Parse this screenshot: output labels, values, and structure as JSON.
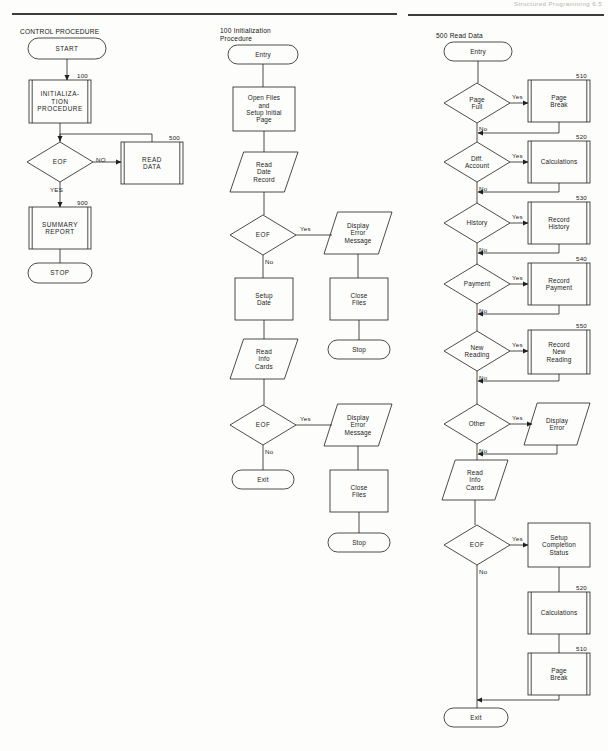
{
  "page": {
    "header_text": "Structured Programming   6.5",
    "background": "#fdfdfb",
    "line_color": "#1f1f1f",
    "width": 608,
    "height": 751
  },
  "columns": [
    {
      "id": "control-procedure",
      "title": "CONTROL PROCEDURE",
      "nodes": [
        {
          "id": "start",
          "shape": "terminator",
          "label": "START",
          "ref": "",
          "x": 28,
          "y": 38,
          "w": 78,
          "h": 21
        },
        {
          "id": "init-proc",
          "shape": "process3d",
          "label": "INITIALIZA-\nTION\nPROCEDURE",
          "ref": "100",
          "x": 29,
          "y": 80,
          "w": 62,
          "h": 43
        },
        {
          "id": "eof-1",
          "shape": "decision",
          "label": "EOF",
          "ref": "",
          "x": 27,
          "y": 142,
          "w": 66,
          "h": 40
        },
        {
          "id": "read-data",
          "shape": "process3d",
          "label": "READ\nDATA",
          "ref": "500",
          "x": 121,
          "y": 142,
          "w": 62,
          "h": 42
        },
        {
          "id": "summary-rpt",
          "shape": "process3d",
          "label": "SUMMARY\nREPORT",
          "ref": "900",
          "x": 29,
          "y": 207,
          "w": 62,
          "h": 42
        },
        {
          "id": "stop-1",
          "shape": "terminator",
          "label": "STOP",
          "ref": "",
          "x": 28,
          "y": 263,
          "w": 64,
          "h": 20
        }
      ],
      "edge_labels": [
        {
          "id": "eof1-no",
          "text": "NO",
          "x": 96,
          "y": 156
        },
        {
          "id": "eof1-yes",
          "text": "YES",
          "x": 50,
          "y": 186
        }
      ]
    },
    {
      "id": "initialization-procedure",
      "title": "100 Initialization\nProcedure",
      "nodes": [
        {
          "id": "entry-2",
          "shape": "terminator",
          "label": "Entry",
          "ref": "",
          "x": 228,
          "y": 45,
          "w": 70,
          "h": 19
        },
        {
          "id": "open-files",
          "shape": "process",
          "label": "Open Files\nand\nSetup Initial\nPage",
          "ref": "",
          "x": 233,
          "y": 87,
          "w": 62,
          "h": 44
        },
        {
          "id": "read-date",
          "shape": "io",
          "label": "Read\nDate\nRecord",
          "ref": "",
          "x": 230,
          "y": 152,
          "w": 68,
          "h": 40
        },
        {
          "id": "eof-2",
          "shape": "decision",
          "label": "EOF",
          "ref": "",
          "x": 230,
          "y": 215,
          "w": 66,
          "h": 40
        },
        {
          "id": "disp-err-1",
          "shape": "io",
          "label": "Display\nError\nMessage",
          "ref": "",
          "x": 324,
          "y": 212,
          "w": 68,
          "h": 42
        },
        {
          "id": "setup-date",
          "shape": "process",
          "label": "Setup\nDate",
          "ref": "",
          "x": 235,
          "y": 278,
          "w": 58,
          "h": 42
        },
        {
          "id": "close-files-1",
          "shape": "process",
          "label": "Close\nFiles",
          "ref": "",
          "x": 330,
          "y": 278,
          "w": 58,
          "h": 42
        },
        {
          "id": "read-info-2",
          "shape": "io",
          "label": "Read\nInfo\nCards",
          "ref": "",
          "x": 230,
          "y": 339,
          "w": 68,
          "h": 40
        },
        {
          "id": "stop-2",
          "shape": "terminator",
          "label": "Stop",
          "ref": "",
          "x": 328,
          "y": 340,
          "w": 62,
          "h": 19
        },
        {
          "id": "eof-3",
          "shape": "decision",
          "label": "EOF",
          "ref": "",
          "x": 230,
          "y": 405,
          "w": 66,
          "h": 40
        },
        {
          "id": "disp-err-2",
          "shape": "io",
          "label": "Display\nError\nMessage",
          "ref": "",
          "x": 324,
          "y": 404,
          "w": 68,
          "h": 42
        },
        {
          "id": "exit-2",
          "shape": "terminator",
          "label": "Exit",
          "ref": "",
          "x": 232,
          "y": 470,
          "w": 62,
          "h": 19
        },
        {
          "id": "close-files-2",
          "shape": "process",
          "label": "Close\nFiles",
          "ref": "",
          "x": 330,
          "y": 470,
          "w": 58,
          "h": 42
        },
        {
          "id": "stop-3",
          "shape": "terminator",
          "label": "Stop",
          "ref": "",
          "x": 328,
          "y": 533,
          "w": 62,
          "h": 19
        }
      ],
      "edge_labels": [
        {
          "id": "eof2-yes",
          "text": "Yes",
          "x": 300,
          "y": 225
        },
        {
          "id": "eof2-no",
          "text": "No",
          "x": 265,
          "y": 258
        },
        {
          "id": "eof3-yes",
          "text": "Yes",
          "x": 300,
          "y": 415
        },
        {
          "id": "eof3-no",
          "text": "No",
          "x": 265,
          "y": 448
        }
      ]
    },
    {
      "id": "read-data",
      "title": "500 Read Data",
      "nodes": [
        {
          "id": "entry-3",
          "shape": "terminator",
          "label": "Entry",
          "ref": "",
          "x": 444,
          "y": 42,
          "w": 68,
          "h": 19
        },
        {
          "id": "page-full",
          "shape": "decision",
          "label": "Page\nFull",
          "ref": "",
          "x": 444,
          "y": 83,
          "w": 66,
          "h": 40
        },
        {
          "id": "page-break-1",
          "shape": "process3d",
          "label": "Page\nBreak",
          "ref": "510",
          "x": 528,
          "y": 80,
          "w": 62,
          "h": 42
        },
        {
          "id": "diff-account",
          "shape": "decision",
          "label": "Diff.\nAccount",
          "ref": "",
          "x": 444,
          "y": 142,
          "w": 66,
          "h": 40
        },
        {
          "id": "calculations-1",
          "shape": "process3d",
          "label": "Calculations",
          "ref": "520",
          "x": 528,
          "y": 141,
          "w": 62,
          "h": 42
        },
        {
          "id": "history",
          "shape": "decision",
          "label": "History",
          "ref": "",
          "x": 444,
          "y": 203,
          "w": 66,
          "h": 40
        },
        {
          "id": "record-history",
          "shape": "process3d",
          "label": "Record\nHistory",
          "ref": "530",
          "x": 528,
          "y": 202,
          "w": 62,
          "h": 42
        },
        {
          "id": "payment",
          "shape": "decision",
          "label": "Payment",
          "ref": "",
          "x": 444,
          "y": 264,
          "w": 66,
          "h": 40
        },
        {
          "id": "record-payment",
          "shape": "process3d",
          "label": "Record\nPayment",
          "ref": "540",
          "x": 528,
          "y": 263,
          "w": 62,
          "h": 42
        },
        {
          "id": "new-reading",
          "shape": "decision",
          "label": "New\nReading",
          "ref": "",
          "x": 444,
          "y": 331,
          "w": 66,
          "h": 40
        },
        {
          "id": "record-new",
          "shape": "process3d",
          "label": "Record\nNew\nReading",
          "ref": "550",
          "x": 528,
          "y": 330,
          "w": 62,
          "h": 44
        },
        {
          "id": "other",
          "shape": "decision",
          "label": "Other",
          "ref": "",
          "x": 444,
          "y": 404,
          "w": 66,
          "h": 40
        },
        {
          "id": "display-error",
          "shape": "io",
          "label": "Display\nError",
          "ref": "",
          "x": 524,
          "y": 403,
          "w": 66,
          "h": 42
        },
        {
          "id": "read-info-3",
          "shape": "io",
          "label": "Read\nInfo\nCards",
          "ref": "",
          "x": 442,
          "y": 460,
          "w": 66,
          "h": 40
        },
        {
          "id": "eof-4",
          "shape": "decision",
          "label": "EOF",
          "ref": "",
          "x": 444,
          "y": 525,
          "w": 66,
          "h": 40
        },
        {
          "id": "setup-compl",
          "shape": "process",
          "label": "Setup\nCompletion\nStatus",
          "ref": "",
          "x": 528,
          "y": 523,
          "w": 62,
          "h": 44
        },
        {
          "id": "calculations-2",
          "shape": "process3d",
          "label": "Calculations",
          "ref": "520",
          "x": 528,
          "y": 592,
          "w": 62,
          "h": 42
        },
        {
          "id": "page-break-2",
          "shape": "process3d",
          "label": "Page\nBreak",
          "ref": "510",
          "x": 528,
          "y": 653,
          "w": 62,
          "h": 42
        },
        {
          "id": "exit-3",
          "shape": "terminator",
          "label": "Exit",
          "ref": "",
          "x": 444,
          "y": 708,
          "w": 64,
          "h": 19
        }
      ],
      "edge_labels": [
        {
          "id": "pagefull-yes",
          "text": "Yes",
          "x": 512,
          "y": 93
        },
        {
          "id": "pagefull-no",
          "text": "No",
          "x": 479,
          "y": 125
        },
        {
          "id": "diff-yes",
          "text": "Yes",
          "x": 512,
          "y": 152
        },
        {
          "id": "diff-no",
          "text": "No",
          "x": 479,
          "y": 185
        },
        {
          "id": "hist-yes",
          "text": "Yes",
          "x": 512,
          "y": 213
        },
        {
          "id": "hist-no",
          "text": "No",
          "x": 479,
          "y": 246
        },
        {
          "id": "pay-yes",
          "text": "Yes",
          "x": 512,
          "y": 274
        },
        {
          "id": "pay-no",
          "text": "No",
          "x": 479,
          "y": 307
        },
        {
          "id": "newrd-yes",
          "text": "Yes",
          "x": 512,
          "y": 341
        },
        {
          "id": "newrd-no",
          "text": "No",
          "x": 479,
          "y": 374
        },
        {
          "id": "other-yes",
          "text": "Yes",
          "x": 512,
          "y": 414
        },
        {
          "id": "other-no",
          "text": "No",
          "x": 479,
          "y": 447
        },
        {
          "id": "eof4-yes",
          "text": "Yes",
          "x": 512,
          "y": 535
        },
        {
          "id": "eof4-no",
          "text": "No",
          "x": 479,
          "y": 568
        }
      ]
    }
  ]
}
